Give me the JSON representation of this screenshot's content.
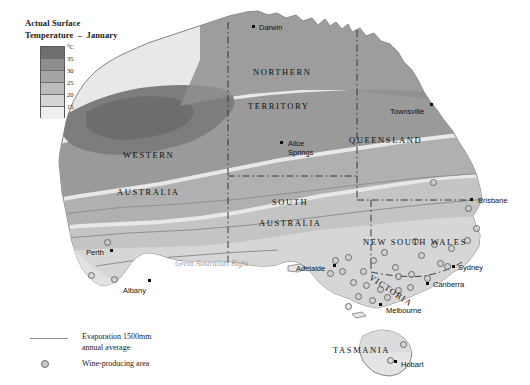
{
  "legend": {
    "title": "Actual Surface\nTemperature  –  January",
    "unit": "°C",
    "ticks": [
      "35",
      "30",
      "25",
      "20",
      "15"
    ],
    "bands": [
      "#6e6e6e",
      "#8e8e8e",
      "#a5a5a5",
      "#bcbcbc",
      "#d6d6d6",
      "#efefef"
    ],
    "evaporation_label": "Evaporation 1500mm\nannual average",
    "wine_label": "Wine-producing area"
  },
  "states": [
    {
      "name": "NORTHERN",
      "x": 253,
      "y": 67
    },
    {
      "name": "TERRITORY",
      "x": 248,
      "y": 101
    },
    {
      "name": "QUEENSLAND",
      "x": 349,
      "y": 135
    },
    {
      "name": "WESTERN",
      "x": 123,
      "y": 150
    },
    {
      "name": "AUSTRALIA",
      "x": 117,
      "y": 187
    },
    {
      "name": "SOUTH",
      "x": 272,
      "y": 197
    },
    {
      "name": "AUSTRALIA",
      "x": 259,
      "y": 218
    },
    {
      "name": "NEW SOUTH WALES",
      "x": 363,
      "y": 237
    },
    {
      "name": "TASMANIA",
      "x": 333,
      "y": 345
    }
  ],
  "victoria": {
    "name": "VICTORIA",
    "x": 373,
    "y": 272
  },
  "cities": [
    {
      "name": "Darwin",
      "lx": 259,
      "ly": 24,
      "dx": 252,
      "dy": 25
    },
    {
      "name": "Townsville",
      "lx": 390,
      "ly": 108,
      "dx": 430,
      "dy": 103
    },
    {
      "name": "Alice\nSprings",
      "lx": 288,
      "ly": 140,
      "dx": 280,
      "dy": 141
    },
    {
      "name": "Brisbane",
      "lx": 478,
      "ly": 197,
      "dx": 470,
      "dy": 198
    },
    {
      "name": "Perth",
      "lx": 86,
      "ly": 249,
      "dx": 110,
      "dy": 249
    },
    {
      "name": "Albany",
      "lx": 123,
      "ly": 287,
      "dx": 148,
      "dy": 279
    },
    {
      "name": "Adelaide",
      "lx": 296,
      "ly": 265,
      "dx": 333,
      "dy": 264
    },
    {
      "name": "Sydney",
      "lx": 458,
      "ly": 264,
      "dx": 452,
      "dy": 265
    },
    {
      "name": "Canberra",
      "lx": 433,
      "ly": 281,
      "dx": 426,
      "dy": 282
    },
    {
      "name": "Melbourne",
      "lx": 386,
      "ly": 307,
      "dx": 379,
      "dy": 303
    },
    {
      "name": "Hobart",
      "lx": 401,
      "ly": 361,
      "dx": 394,
      "dy": 360
    }
  ],
  "seas": [
    {
      "name": "Gulf of\nCarpentaria",
      "x": 305,
      "y": 23
    },
    {
      "name": "Great Australian Bight",
      "x": 175,
      "y": 258
    }
  ],
  "wine_areas": [
    {
      "x": 104,
      "y": 239
    },
    {
      "x": 88,
      "y": 272
    },
    {
      "x": 111,
      "y": 276
    },
    {
      "x": 430,
      "y": 179
    },
    {
      "x": 465,
      "y": 205
    },
    {
      "x": 473,
      "y": 225
    },
    {
      "x": 464,
      "y": 237
    },
    {
      "x": 448,
      "y": 245
    },
    {
      "x": 431,
      "y": 241
    },
    {
      "x": 412,
      "y": 238
    },
    {
      "x": 418,
      "y": 252
    },
    {
      "x": 437,
      "y": 260
    },
    {
      "x": 444,
      "y": 263
    },
    {
      "x": 408,
      "y": 271
    },
    {
      "x": 424,
      "y": 275
    },
    {
      "x": 392,
      "y": 264
    },
    {
      "x": 370,
      "y": 257
    },
    {
      "x": 381,
      "y": 249
    },
    {
      "x": 360,
      "y": 268
    },
    {
      "x": 345,
      "y": 254
    },
    {
      "x": 332,
      "y": 257
    },
    {
      "x": 339,
      "y": 268
    },
    {
      "x": 327,
      "y": 270
    },
    {
      "x": 350,
      "y": 279
    },
    {
      "x": 363,
      "y": 282
    },
    {
      "x": 377,
      "y": 286
    },
    {
      "x": 395,
      "y": 287
    },
    {
      "x": 407,
      "y": 284
    },
    {
      "x": 355,
      "y": 293
    },
    {
      "x": 369,
      "y": 297
    },
    {
      "x": 384,
      "y": 294
    },
    {
      "x": 345,
      "y": 303
    },
    {
      "x": 395,
      "y": 273
    },
    {
      "x": 400,
      "y": 341
    },
    {
      "x": 387,
      "y": 357
    }
  ]
}
